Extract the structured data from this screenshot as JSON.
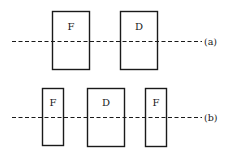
{
  "diagram": {
    "type": "lens-arrangement",
    "configurations": [
      {
        "id": "a",
        "label": "(a)",
        "elements": [
          {
            "label": "F",
            "role": "focusing"
          },
          {
            "label": "D",
            "role": "defocusing"
          }
        ]
      },
      {
        "id": "b",
        "label": "(b)",
        "elements": [
          {
            "label": "F",
            "role": "focusing"
          },
          {
            "label": "D",
            "role": "defocusing"
          },
          {
            "label": "F",
            "role": "focusing"
          }
        ]
      }
    ],
    "colors": {
      "stroke": "#1a1a1a",
      "background": "#ffffff"
    }
  }
}
